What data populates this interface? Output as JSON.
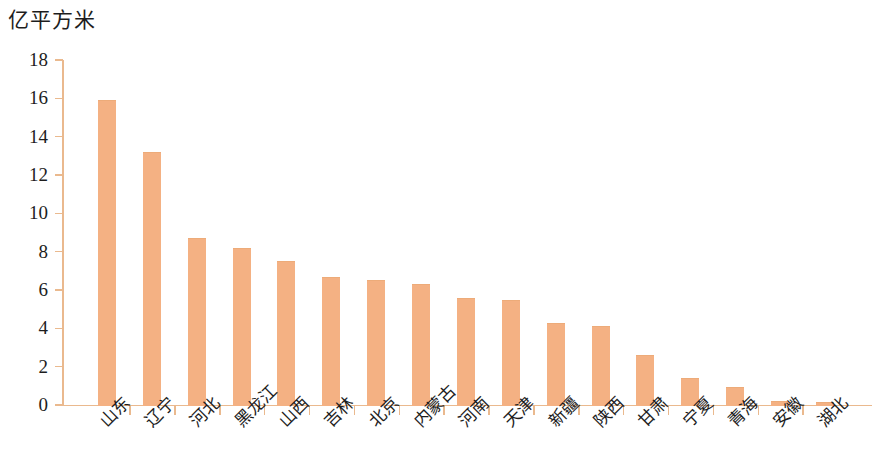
{
  "chart_data": {
    "type": "bar",
    "title": "",
    "unit_label": "亿平方米",
    "xlabel": "",
    "ylabel": "亿平方米",
    "ylim": [
      0,
      18
    ],
    "y_ticks": [
      0,
      2,
      4,
      6,
      8,
      10,
      12,
      14,
      16,
      18
    ],
    "grid": false,
    "legend": null,
    "bar_color": "#F4B183",
    "axis_color": "#EAB98E",
    "categories": [
      "山东",
      "辽宁",
      "河北",
      "黑龙江",
      "山西",
      "吉林",
      "北京",
      "内蒙古",
      "河南",
      "天津",
      "新疆",
      "陕西",
      "甘肃",
      "宁夏",
      "青海",
      "安徽",
      "湖北"
    ],
    "values": [
      15.9,
      13.2,
      8.7,
      8.2,
      7.5,
      6.7,
      6.5,
      6.3,
      5.6,
      5.5,
      4.3,
      4.1,
      2.6,
      1.4,
      0.95,
      0.2,
      0.15
    ]
  }
}
